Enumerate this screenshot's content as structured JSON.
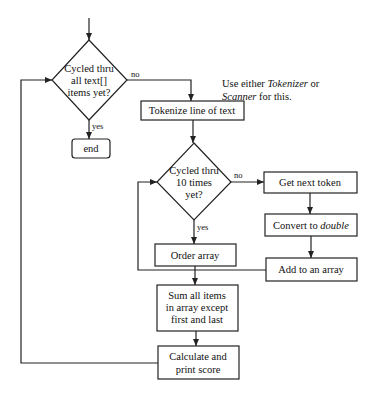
{
  "diagram": {
    "type": "flowchart",
    "nodes": {
      "decision_text_items": {
        "lines": [
          "Cycled thru",
          "all text[]",
          "items yet?"
        ],
        "shape": "diamond"
      },
      "end": {
        "label": "end",
        "shape": "rounded-rect"
      },
      "tokenize": {
        "label": "Tokenize line of text",
        "shape": "rect"
      },
      "note": {
        "line1_prefix": "Use either ",
        "line1_italic": "Tokenizer",
        "line1_suffix": " or",
        "line2_italic": "Scanner",
        "line2_suffix": " for this."
      },
      "decision_ten_times": {
        "lines": [
          "Cycled thru",
          "10 times",
          "yet?"
        ],
        "shape": "diamond"
      },
      "get_next_token": {
        "label": "Get next token",
        "shape": "rect"
      },
      "convert": {
        "prefix": "Convert to ",
        "italic": "double",
        "shape": "rect"
      },
      "add_to_array": {
        "label": "Add to an array",
        "shape": "rect"
      },
      "order_array": {
        "label": "Order array",
        "shape": "rect"
      },
      "sum_items": {
        "lines": [
          "Sum all items",
          "in array except",
          "first and last"
        ],
        "shape": "rect"
      },
      "calc_score": {
        "lines": [
          "Calculate and",
          "print score"
        ],
        "shape": "rect"
      }
    },
    "edge_labels": {
      "d1_no": "no",
      "d1_yes": "yes",
      "d2_no": "no",
      "d2_yes": "yes"
    }
  }
}
